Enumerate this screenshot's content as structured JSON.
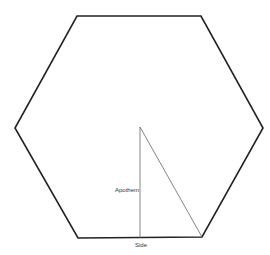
{
  "diagram": {
    "type": "regular-hexagon",
    "vertices": [
      [
        77,
        16
      ],
      [
        201,
        16
      ],
      [
        263,
        128
      ],
      [
        202,
        237
      ],
      [
        78,
        238
      ],
      [
        15,
        128
      ]
    ],
    "center": [
      140,
      127
    ],
    "stroke_color": "#222222",
    "construction_color": "#666666",
    "labels": {
      "apothem": "Apothem",
      "side": "Side"
    }
  }
}
